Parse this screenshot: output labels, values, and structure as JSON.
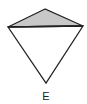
{
  "diagram": {
    "shape": "kite",
    "label": "E",
    "regions": [
      {
        "name": "top-triangle",
        "shaded": true,
        "fill": "#c8c8c8"
      },
      {
        "name": "bottom-triangle",
        "shaded": false,
        "fill": "#ffffff"
      }
    ],
    "stroke_color": "#222222"
  }
}
